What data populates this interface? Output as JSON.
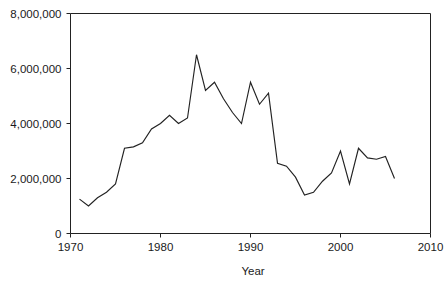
{
  "chart_data": {
    "type": "line",
    "title": "",
    "subtitle": "",
    "xlabel": "Year",
    "ylabel": "",
    "xlim": [
      1970,
      2010
    ],
    "ylim": [
      0,
      8000000
    ],
    "grid": false,
    "legend": null,
    "x_ticks": [
      1970,
      1980,
      1990,
      2000,
      2010
    ],
    "x_tick_labels": [
      "1970",
      "1980",
      "1990",
      "2000",
      "2010"
    ],
    "y_ticks": [
      0,
      2000000,
      4000000,
      6000000,
      8000000
    ],
    "y_tick_labels": [
      "0",
      "2,000,000",
      "4,000,000",
      "6,000,000",
      "8,000,000"
    ],
    "line_color": "#222222",
    "series": [
      {
        "name": "series-1",
        "x": [
          1971,
          1972,
          1973,
          1974,
          1975,
          1976,
          1977,
          1978,
          1979,
          1980,
          1981,
          1982,
          1983,
          1984,
          1985,
          1986,
          1987,
          1988,
          1989,
          1990,
          1991,
          1992,
          1993,
          1994,
          1995,
          1996,
          1997,
          1998,
          1999,
          2000,
          2001,
          2002,
          2003,
          2004,
          2005,
          2006
        ],
        "values": [
          1250000,
          1000000,
          1300000,
          1500000,
          1800000,
          3100000,
          3150000,
          3300000,
          3800000,
          4000000,
          4300000,
          4000000,
          4200000,
          6500000,
          5200000,
          5500000,
          4900000,
          4400000,
          4000000,
          5500000,
          4700000,
          5100000,
          2550000,
          2450000,
          2050000,
          1400000,
          1500000,
          1900000,
          2200000,
          3000000,
          1800000,
          3100000,
          2750000,
          2700000,
          2800000,
          2000000
        ]
      }
    ]
  },
  "axes": {
    "x_axis_label": "Year",
    "y_axis_label": ""
  }
}
